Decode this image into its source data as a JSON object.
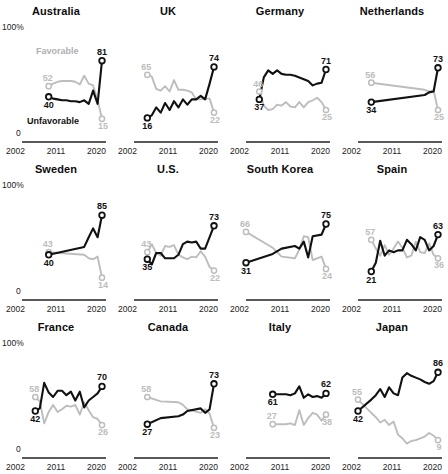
{
  "figure": {
    "y_axis_top_label": "100%",
    "y_axis_bottom_label": "0",
    "x_ticks": [
      "2002",
      "2011",
      "2020"
    ],
    "legend": {
      "favorable": "Favorable",
      "unfavorable": "Unfavorable"
    },
    "colors": {
      "unfavorable_line": "#111111",
      "favorable_line": "#bdbdbd",
      "axis": "#222222",
      "background": "#ffffff"
    }
  },
  "chart_data": {
    "type": "line",
    "title": "",
    "xlabel": "",
    "ylabel": "",
    "xlim": [
      2002,
      2020
    ],
    "ylim": [
      0,
      100
    ],
    "grid": false,
    "legend_position": "panel-1-inline",
    "series_names": [
      "Unfavorable",
      "Favorable"
    ],
    "panels": [
      {
        "name": "Australia",
        "unfavorable": {
          "start_label": "40",
          "end_label": "81",
          "x": [
            2008,
            2009,
            2010,
            2011,
            2012,
            2013,
            2014,
            2015,
            2016,
            2017,
            2018,
            2019,
            2020
          ],
          "y": [
            40,
            38,
            37,
            36,
            36,
            35,
            35,
            34,
            36,
            32,
            47,
            32,
            81
          ]
        },
        "favorable": {
          "start_label": "52",
          "end_label": "15",
          "x": [
            2008,
            2009,
            2010,
            2011,
            2012,
            2013,
            2014,
            2015,
            2016,
            2017,
            2018,
            2019,
            2020
          ],
          "y": [
            52,
            55,
            57,
            58,
            58,
            58,
            57,
            54,
            64,
            55,
            53,
            36,
            15
          ]
        }
      },
      {
        "name": "UK",
        "unfavorable": {
          "start_label": "16",
          "end_label": "74",
          "x": [
            2005,
            2006,
            2007,
            2008,
            2009,
            2010,
            2011,
            2012,
            2013,
            2014,
            2015,
            2016,
            2017,
            2018,
            2019,
            2020
          ],
          "y": [
            16,
            19,
            28,
            22,
            33,
            25,
            35,
            28,
            37,
            31,
            37,
            37,
            41,
            37,
            55,
            74
          ]
        },
        "favorable": {
          "start_label": "65",
          "end_label": "22",
          "x": [
            2005,
            2006,
            2007,
            2008,
            2009,
            2010,
            2011,
            2012,
            2013,
            2014,
            2015,
            2016,
            2017,
            2018,
            2019,
            2020
          ],
          "y": [
            65,
            63,
            49,
            47,
            52,
            46,
            59,
            48,
            48,
            47,
            45,
            37,
            37,
            38,
            38,
            22
          ]
        }
      },
      {
        "name": "Germany",
        "unfavorable": {
          "start_label": "37",
          "end_label": "71",
          "x": [
            2005,
            2006,
            2007,
            2008,
            2009,
            2010,
            2011,
            2012,
            2013,
            2014,
            2015,
            2016,
            2017,
            2018,
            2019,
            2020
          ],
          "y": [
            37,
            62,
            70,
            66,
            70,
            66,
            65,
            65,
            64,
            62,
            60,
            58,
            53,
            55,
            56,
            71
          ]
        },
        "favorable": {
          "start_label": "46",
          "end_label": "25",
          "x": [
            2005,
            2006,
            2007,
            2008,
            2009,
            2010,
            2011,
            2012,
            2013,
            2014,
            2015,
            2016,
            2017,
            2018,
            2019,
            2020
          ],
          "y": [
            46,
            30,
            25,
            26,
            31,
            30,
            34,
            29,
            28,
            34,
            28,
            34,
            36,
            39,
            34,
            25
          ]
        }
      },
      {
        "name": "Netherlands",
        "unfavorable": {
          "start_label": "34",
          "end_label": "73",
          "x": [
            2005,
            2017,
            2018,
            2019,
            2020
          ],
          "y": [
            34,
            42,
            45,
            46,
            73
          ]
        },
        "favorable": {
          "start_label": "56",
          "end_label": "25",
          "x": [
            2005,
            2017,
            2018,
            2019,
            2020
          ],
          "y": [
            56,
            48,
            46,
            47,
            25
          ]
        }
      },
      {
        "name": "Sweden",
        "unfavorable": {
          "start_label": "40",
          "end_label": "85",
          "x": [
            2008,
            2016,
            2017,
            2018,
            2019,
            2020
          ],
          "y": [
            40,
            49,
            60,
            70,
            60,
            85
          ]
        },
        "favorable": {
          "start_label": "43",
          "end_label": "14",
          "x": [
            2008,
            2016,
            2017,
            2018,
            2019,
            2020
          ],
          "y": [
            43,
            40,
            36,
            35,
            38,
            14
          ]
        }
      },
      {
        "name": "U.S.",
        "unfavorable": {
          "start_label": "35",
          "end_label": "73",
          "x": [
            2005,
            2006,
            2007,
            2008,
            2009,
            2010,
            2011,
            2012,
            2013,
            2014,
            2015,
            2016,
            2017,
            2018,
            2019,
            2020
          ],
          "y": [
            35,
            29,
            42,
            42,
            36,
            36,
            36,
            40,
            52,
            55,
            54,
            55,
            47,
            47,
            60,
            73
          ]
        },
        "favorable": {
          "start_label": "43",
          "end_label": "22",
          "x": [
            2005,
            2006,
            2007,
            2008,
            2009,
            2010,
            2011,
            2012,
            2013,
            2014,
            2015,
            2016,
            2017,
            2018,
            2019,
            2020
          ],
          "y": [
            43,
            52,
            42,
            39,
            50,
            49,
            51,
            40,
            37,
            35,
            38,
            37,
            44,
            38,
            26,
            22
          ]
        }
      },
      {
        "name": "South Korea",
        "unfavorable": {
          "start_label": "31",
          "end_label": "75",
          "x": [
            2002,
            2008,
            2010,
            2013,
            2014,
            2015,
            2016,
            2017,
            2019,
            2020
          ],
          "y": [
            31,
            41,
            47,
            50,
            47,
            55,
            37,
            61,
            63,
            75
          ]
        },
        "favorable": {
          "start_label": "66",
          "end_label": "24",
          "x": [
            2002,
            2008,
            2010,
            2013,
            2014,
            2015,
            2016,
            2017,
            2019,
            2020
          ],
          "y": [
            66,
            48,
            38,
            36,
            46,
            61,
            60,
            34,
            38,
            24
          ]
        }
      },
      {
        "name": "Spain",
        "unfavorable": {
          "start_label": "21",
          "end_label": "63",
          "x": [
            2005,
            2006,
            2007,
            2008,
            2009,
            2010,
            2011,
            2012,
            2013,
            2014,
            2015,
            2016,
            2017,
            2018,
            2019,
            2020
          ],
          "y": [
            21,
            31,
            56,
            39,
            45,
            43,
            45,
            45,
            57,
            52,
            45,
            60,
            57,
            45,
            50,
            63
          ]
        },
        "favorable": {
          "start_label": "57",
          "end_label": "36",
          "x": [
            2005,
            2006,
            2007,
            2008,
            2009,
            2010,
            2011,
            2012,
            2013,
            2014,
            2015,
            2016,
            2017,
            2018,
            2019,
            2020
          ],
          "y": [
            57,
            47,
            39,
            51,
            40,
            47,
            55,
            48,
            37,
            39,
            55,
            43,
            42,
            53,
            40,
            36
          ]
        }
      },
      {
        "name": "France",
        "unfavorable": {
          "start_label": "42",
          "end_label": "70",
          "x": [
            2005,
            2006,
            2007,
            2008,
            2009,
            2010,
            2011,
            2012,
            2013,
            2014,
            2015,
            2016,
            2017,
            2018,
            2019,
            2020
          ],
          "y": [
            42,
            45,
            74,
            63,
            58,
            65,
            65,
            60,
            64,
            54,
            64,
            46,
            54,
            58,
            62,
            70
          ]
        },
        "favorable": {
          "start_label": "58",
          "end_label": "26",
          "x": [
            2005,
            2006,
            2007,
            2008,
            2009,
            2010,
            2011,
            2012,
            2013,
            2014,
            2015,
            2016,
            2017,
            2018,
            2019,
            2020
          ],
          "y": [
            58,
            53,
            28,
            41,
            49,
            41,
            44,
            48,
            47,
            49,
            38,
            52,
            43,
            35,
            33,
            26
          ]
        }
      },
      {
        "name": "Canada",
        "unfavorable": {
          "start_label": "27",
          "end_label": "73",
          "x": [
            2005,
            2008,
            2012,
            2013,
            2014,
            2017,
            2018,
            2019,
            2020
          ],
          "y": [
            27,
            34,
            36,
            38,
            42,
            45,
            40,
            44,
            73
          ]
        },
        "favorable": {
          "start_label": "58",
          "end_label": "23",
          "x": [
            2005,
            2008,
            2012,
            2013,
            2014,
            2017,
            2018,
            2019,
            2020
          ],
          "y": [
            58,
            53,
            52,
            49,
            44,
            40,
            44,
            39,
            23
          ]
        }
      },
      {
        "name": "Italy",
        "unfavorable": {
          "start_label": "61",
          "end_label": "62",
          "x": [
            2008,
            2011,
            2012,
            2013,
            2014,
            2015,
            2016,
            2017,
            2018,
            2019,
            2020
          ],
          "y": [
            61,
            61,
            60,
            62,
            70,
            57,
            61,
            58,
            59,
            57,
            62
          ]
        },
        "favorable": {
          "start_label": "27",
          "end_label": "38",
          "x": [
            2008,
            2011,
            2012,
            2013,
            2014,
            2015,
            2016,
            2017,
            2018,
            2019,
            2020
          ],
          "y": [
            27,
            27,
            28,
            26,
            43,
            26,
            34,
            40,
            38,
            31,
            38
          ]
        }
      },
      {
        "name": "Japan",
        "unfavorable": {
          "start_label": "42",
          "end_label": "86",
          "x": [
            2002,
            2005,
            2006,
            2007,
            2008,
            2009,
            2010,
            2011,
            2012,
            2013,
            2014,
            2015,
            2016,
            2017,
            2018,
            2019,
            2020
          ],
          "y": [
            42,
            55,
            60,
            67,
            58,
            69,
            62,
            60,
            80,
            85,
            82,
            80,
            78,
            75,
            73,
            76,
            86
          ]
        },
        "favorable": {
          "start_label": "55",
          "end_label": "9",
          "x": [
            2002,
            2005,
            2006,
            2007,
            2008,
            2009,
            2010,
            2011,
            2012,
            2013,
            2014,
            2015,
            2016,
            2017,
            2018,
            2019,
            2020
          ],
          "y": [
            55,
            40,
            35,
            29,
            32,
            26,
            30,
            15,
            11,
            5,
            8,
            9,
            11,
            13,
            17,
            14,
            9
          ]
        }
      }
    ]
  }
}
